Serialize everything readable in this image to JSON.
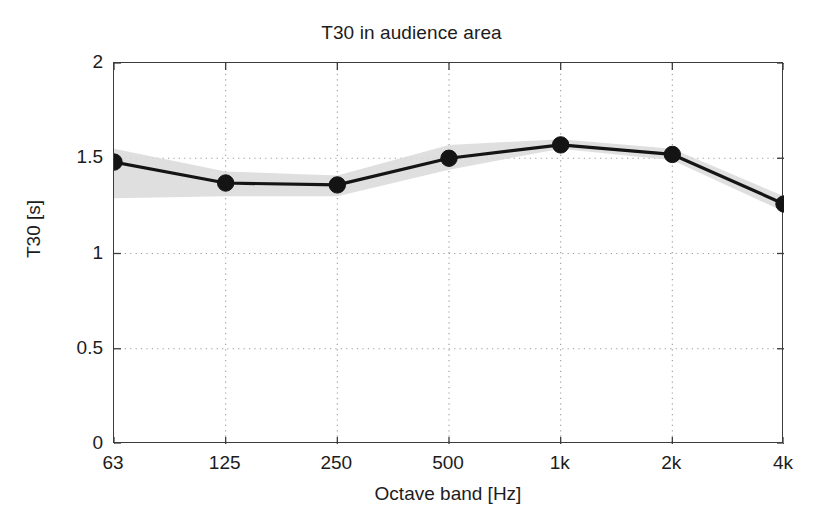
{
  "figure": {
    "title": "T30 in audience area",
    "background_color": "#ffffff",
    "axis_color": "#3c3c3c",
    "grid_color": "#9a9a9a",
    "line_color": "#141414",
    "band_color": "#d6d6d6"
  },
  "chart_data": {
    "type": "line",
    "title": "T30 in audience area",
    "xlabel": "Octave band [Hz]",
    "ylabel": "T30 [s]",
    "categories": [
      "63",
      "125",
      "250",
      "500",
      "1k",
      "2k",
      "4k"
    ],
    "x_tick_labels": [
      "63",
      "125",
      "250",
      "500",
      "1k",
      "2k",
      "4k"
    ],
    "y_tick_labels": [
      "0",
      "0.5",
      "1",
      "1.5",
      "2"
    ],
    "y_tick_values": [
      0,
      0.5,
      1,
      1.5,
      2
    ],
    "ylim": [
      0,
      2
    ],
    "xlim": [
      0,
      6
    ],
    "grid": true,
    "grid_style": "dotted",
    "legend": "none",
    "marker": "filled-circle",
    "series": [
      {
        "name": "T30 mean",
        "values": [
          1.48,
          1.37,
          1.36,
          1.5,
          1.57,
          1.52,
          1.26
        ]
      },
      {
        "name": "T30 upper bound (shaded band)",
        "values": [
          1.55,
          1.43,
          1.41,
          1.57,
          1.6,
          1.55,
          1.3
        ]
      },
      {
        "name": "T30 lower bound (shaded band)",
        "values": [
          1.29,
          1.3,
          1.3,
          1.44,
          1.55,
          1.49,
          1.22
        ]
      }
    ]
  },
  "axes": {
    "x_label": "Octave band [Hz]",
    "y_label": "T30 [s]"
  }
}
